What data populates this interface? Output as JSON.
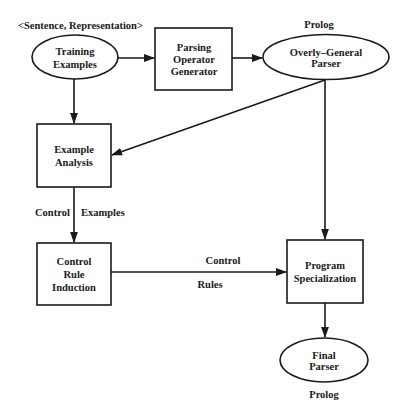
{
  "diagram": {
    "top_label": "<Sentence, Representation>",
    "prolog_top": "Prolog",
    "prolog_bottom": "Prolog",
    "nodes": {
      "training_examples": {
        "line1": "Training",
        "line2": "Examples",
        "shape": "ellipse"
      },
      "parsing_operator_generator": {
        "line1": "Parsing",
        "line2": "Operator",
        "line3": "Generator",
        "shape": "box"
      },
      "overly_general_parser": {
        "line1": "Overly–General",
        "line2": "Parser",
        "shape": "ellipse"
      },
      "example_analysis": {
        "line1": "Example",
        "line2": "Analysis",
        "shape": "box"
      },
      "control_rule_induction": {
        "line1": "Control",
        "line2": "Rule",
        "line3": "Induction",
        "shape": "box"
      },
      "program_specialization": {
        "line1": "Program",
        "line2": "Specialization",
        "shape": "box"
      },
      "final_parser": {
        "line1": "Final",
        "line2": "Parser",
        "shape": "ellipse"
      }
    },
    "edge_labels": {
      "control_examples_left": "Control",
      "control_examples_right": "Examples",
      "control_rules_top": "Control",
      "control_rules_bottom": "Rules"
    },
    "edges": [
      {
        "from": "Training Examples",
        "to": "Parsing Operator Generator"
      },
      {
        "from": "Parsing Operator Generator",
        "to": "Overly-General Parser"
      },
      {
        "from": "Training Examples",
        "to": "Example Analysis"
      },
      {
        "from": "Overly-General Parser",
        "to": "Example Analysis"
      },
      {
        "from": "Overly-General Parser",
        "to": "Program Specialization"
      },
      {
        "from": "Example Analysis",
        "to": "Control Rule Induction",
        "label": "Control Examples"
      },
      {
        "from": "Control Rule Induction",
        "to": "Program Specialization",
        "label": "Control Rules"
      },
      {
        "from": "Program Specialization",
        "to": "Final Parser"
      }
    ]
  }
}
